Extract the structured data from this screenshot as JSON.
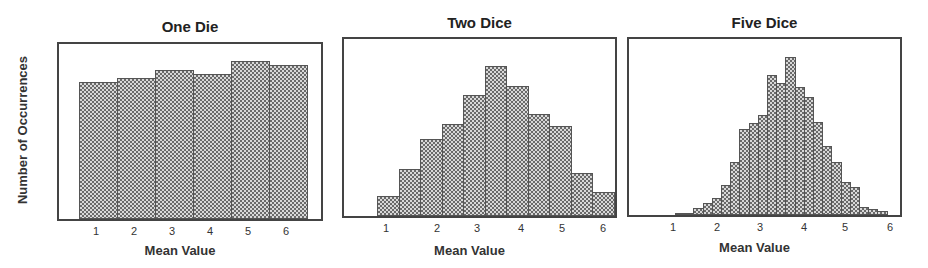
{
  "figure": {
    "ylabel": "Number of Occurrences"
  },
  "chart_data": [
    {
      "type": "bar",
      "title": "One Die",
      "xlabel": "Mean Value",
      "ylabel": "Number of Occurrences",
      "xticks": [
        "1",
        "2",
        "3",
        "4",
        "5",
        "6"
      ],
      "categories": [
        1,
        2,
        3,
        4,
        5,
        6
      ],
      "values": [
        137,
        141,
        149,
        145,
        158,
        154
      ],
      "grid": false
    },
    {
      "type": "bar",
      "title": "Two Dice",
      "xlabel": "Mean Value",
      "ylabel": "Number of Occurrences",
      "xticks": [
        "1",
        "2",
        "3",
        "4",
        "5",
        "6"
      ],
      "categories": [
        1.0,
        1.5,
        2.0,
        2.5,
        3.0,
        3.5,
        4.0,
        4.5,
        5.0,
        5.5,
        6.0
      ],
      "values": [
        20,
        47,
        77,
        92,
        121,
        150,
        130,
        102,
        90,
        43,
        24
      ],
      "grid": false
    },
    {
      "type": "bar",
      "title": "Five Dice",
      "xlabel": "Mean Value",
      "ylabel": "Number of Occurrences",
      "xticks": [
        "1",
        "2",
        "3",
        "4",
        "5",
        "6"
      ],
      "categories": [
        1.2,
        1.4,
        1.6,
        1.8,
        2.0,
        2.2,
        2.4,
        2.6,
        2.8,
        3.0,
        3.2,
        3.4,
        3.6,
        3.8,
        4.0,
        4.2,
        4.4,
        4.6,
        4.8,
        5.0,
        5.2,
        5.4,
        5.6
      ],
      "values": [
        1,
        1,
        7,
        12,
        17,
        30,
        53,
        86,
        92,
        100,
        140,
        132,
        158,
        128,
        118,
        93,
        69,
        53,
        33,
        28,
        8,
        6,
        4
      ],
      "grid": false
    }
  ]
}
